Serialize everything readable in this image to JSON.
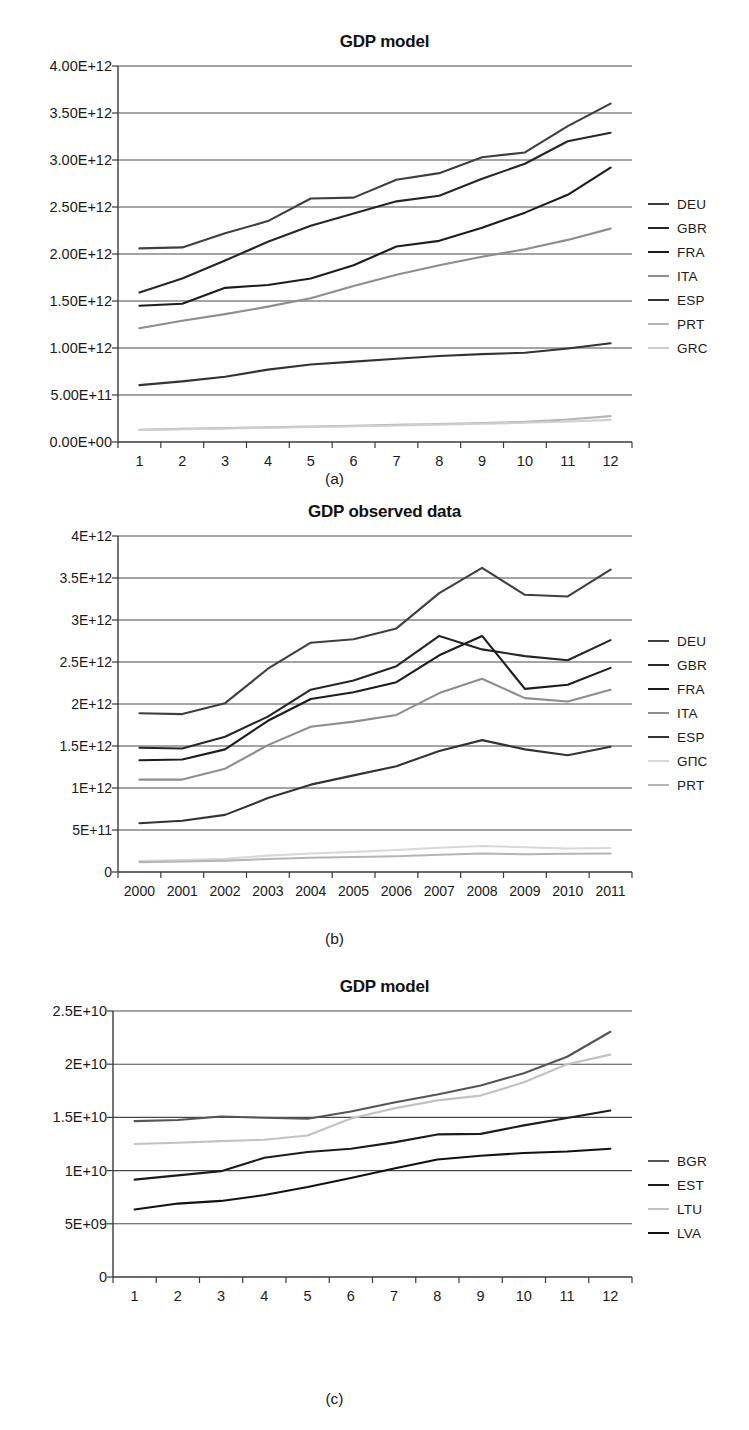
{
  "page": {
    "background": "#ffffff",
    "axis_color": "#3a3a3a",
    "grid_color": "#4a4a4a"
  },
  "figures": [
    {
      "id": "a",
      "caption": "(a)",
      "title": "GDP model",
      "legend": [
        {
          "label": "DEU",
          "color": "#3f3f3f",
          "width": 2.1
        },
        {
          "label": "GBR",
          "color": "#262626",
          "width": 2.1
        },
        {
          "label": "FRA",
          "color": "#1c1c1c",
          "width": 2.1
        },
        {
          "label": "ITA",
          "color": "#8d8d8d",
          "width": 2.1
        },
        {
          "label": "ESP",
          "color": "#333333",
          "width": 2.1
        },
        {
          "label": "PRT",
          "color": "#b5b5b5",
          "width": 2.1
        },
        {
          "label": "GRC",
          "color": "#cfcfcf",
          "width": 2.1
        }
      ]
    },
    {
      "id": "b",
      "caption": "(b)",
      "title": "GDP observed data",
      "legend": [
        {
          "label": "DEU",
          "color": "#3f3f3f",
          "width": 2.1
        },
        {
          "label": "GBR",
          "color": "#262626",
          "width": 2.1
        },
        {
          "label": "FRA",
          "color": "#1c1c1c",
          "width": 2.1
        },
        {
          "label": "ITA",
          "color": "#8d8d8d",
          "width": 2.1
        },
        {
          "label": "ESP",
          "color": "#333333",
          "width": 2.1
        },
        {
          "label": "GПC",
          "color": "#d8d8d8",
          "width": 2.1
        },
        {
          "label": "PRT",
          "color": "#b5b5b5",
          "width": 2.1
        }
      ]
    },
    {
      "id": "c",
      "caption": "(c)",
      "title": "GDP model",
      "legend": [
        {
          "label": "BGR",
          "color": "#555555",
          "width": 2.1
        },
        {
          "label": "EST",
          "color": "#1c1c1c",
          "width": 2.3
        },
        {
          "label": "LTU",
          "color": "#c2c2c2",
          "width": 2.1
        },
        {
          "label": "LVA",
          "color": "#111111",
          "width": 2.3
        }
      ]
    }
  ],
  "chart_data": [
    {
      "type": "line",
      "panel": "(a)",
      "title": "GDP model",
      "xlabel": "",
      "ylabel": "",
      "x": [
        1,
        2,
        3,
        4,
        5,
        6,
        7,
        8,
        9,
        10,
        11,
        12
      ],
      "xticklabels": [
        "1",
        "2",
        "3",
        "4",
        "5",
        "6",
        "7",
        "8",
        "9",
        "10",
        "11",
        "12"
      ],
      "ylim": [
        0,
        4000000000000.0
      ],
      "yticks": [
        0,
        500000000000.0,
        1000000000000.0,
        1500000000000.0,
        2000000000000.0,
        2500000000000.0,
        3000000000000.0,
        3500000000000.0,
        4000000000000.0
      ],
      "yticklabels": [
        "0.00E+00",
        "5.00E+11",
        "1.00E+12",
        "1.50E+12",
        "2.00E+12",
        "2.50E+12",
        "3.00E+12",
        "3.50E+12",
        "4.00E+12"
      ],
      "grid": true,
      "legend_position": "right",
      "series": [
        {
          "name": "DEU",
          "color": "#3f3f3f",
          "values": [
            2060000000000.0,
            2070000000000.0,
            2220000000000.0,
            2350000000000.0,
            2590000000000.0,
            2600000000000.0,
            2790000000000.0,
            2860000000000.0,
            3030000000000.0,
            3080000000000.0,
            3360000000000.0,
            3600000000000.0
          ]
        },
        {
          "name": "GBR",
          "color": "#262626",
          "values": [
            1590000000000.0,
            1740000000000.0,
            1930000000000.0,
            2130000000000.0,
            2300000000000.0,
            2430000000000.0,
            2560000000000.0,
            2620000000000.0,
            2800000000000.0,
            2960000000000.0,
            3200000000000.0,
            3290000000000.0
          ]
        },
        {
          "name": "FRA",
          "color": "#1c1c1c",
          "values": [
            1450000000000.0,
            1470000000000.0,
            1640000000000.0,
            1670000000000.0,
            1740000000000.0,
            1880000000000.0,
            2080000000000.0,
            2140000000000.0,
            2280000000000.0,
            2440000000000.0,
            2630000000000.0,
            2920000000000.0
          ]
        },
        {
          "name": "ITA",
          "color": "#8d8d8d",
          "values": [
            1210000000000.0,
            1290000000000.0,
            1360000000000.0,
            1440000000000.0,
            1530000000000.0,
            1660000000000.0,
            1780000000000.0,
            1880000000000.0,
            1970000000000.0,
            2050000000000.0,
            2150000000000.0,
            2270000000000.0
          ]
        },
        {
          "name": "ESP",
          "color": "#333333",
          "values": [
            605000000000.0,
            645000000000.0,
            695000000000.0,
            770000000000.0,
            825000000000.0,
            855000000000.0,
            885000000000.0,
            915000000000.0,
            935000000000.0,
            950000000000.0,
            995000000000.0,
            1050000000000.0
          ]
        },
        {
          "name": "PRT",
          "color": "#b5b5b5",
          "values": [
            130000000000.0,
            140000000000.0,
            148000000000.0,
            156000000000.0,
            164000000000.0,
            172000000000.0,
            182000000000.0,
            192000000000.0,
            202000000000.0,
            214000000000.0,
            240000000000.0,
            275000000000.0
          ]
        },
        {
          "name": "GRC",
          "color": "#cfcfcf",
          "values": [
            127000000000.0,
            136000000000.0,
            144000000000.0,
            152000000000.0,
            159000000000.0,
            167000000000.0,
            176000000000.0,
            185000000000.0,
            194000000000.0,
            204000000000.0,
            218000000000.0,
            235000000000.0
          ]
        }
      ]
    },
    {
      "type": "line",
      "panel": "(b)",
      "title": "GDP observed data",
      "xlabel": "",
      "ylabel": "",
      "x": [
        2000,
        2001,
        2002,
        2003,
        2004,
        2005,
        2006,
        2007,
        2008,
        2009,
        2010,
        2011
      ],
      "xticklabels": [
        "2000",
        "2001",
        "2002",
        "2003",
        "2004",
        "2005",
        "2006",
        "2007",
        "2008",
        "2009",
        "2010",
        "2011"
      ],
      "ylim": [
        0,
        4000000000000.0
      ],
      "yticks": [
        0,
        500000000000.0,
        1000000000000.0,
        1500000000000.0,
        2000000000000.0,
        2500000000000.0,
        3000000000000.0,
        3500000000000.0,
        4000000000000.0
      ],
      "yticklabels": [
        "0",
        "5E+11",
        "1E+12",
        "1.5E+12",
        "2E+12",
        "2.5E+12",
        "3E+12",
        "3.5E+12",
        "4E+12"
      ],
      "grid": true,
      "legend_position": "right",
      "series": [
        {
          "name": "DEU",
          "color": "#3f3f3f",
          "values": [
            1890000000000.0,
            1880000000000.0,
            2010000000000.0,
            2420000000000.0,
            2730000000000.0,
            2770000000000.0,
            2900000000000.0,
            3320000000000.0,
            3620000000000.0,
            3300000000000.0,
            3280000000000.0,
            3600000000000.0
          ]
        },
        {
          "name": "GBR",
          "color": "#262626",
          "values": [
            1480000000000.0,
            1470000000000.0,
            1610000000000.0,
            1850000000000.0,
            2170000000000.0,
            2280000000000.0,
            2450000000000.0,
            2810000000000.0,
            2650000000000.0,
            2570000000000.0,
            2520000000000.0,
            2760000000000.0
          ]
        },
        {
          "name": "FRA",
          "color": "#1c1c1c",
          "values": [
            1330000000000.0,
            1340000000000.0,
            1460000000000.0,
            1800000000000.0,
            2060000000000.0,
            2140000000000.0,
            2260000000000.0,
            2580000000000.0,
            2810000000000.0,
            2180000000000.0,
            2230000000000.0,
            2430000000000.0
          ]
        },
        {
          "name": "ITA",
          "color": "#8d8d8d",
          "values": [
            1100000000000.0,
            1100000000000.0,
            1230000000000.0,
            1510000000000.0,
            1730000000000.0,
            1790000000000.0,
            1870000000000.0,
            2130000000000.0,
            2300000000000.0,
            2070000000000.0,
            2030000000000.0,
            2170000000000.0
          ]
        },
        {
          "name": "ESP",
          "color": "#333333",
          "values": [
            580000000000.0,
            610000000000.0,
            680000000000.0,
            880000000000.0,
            1040000000000.0,
            1150000000000.0,
            1260000000000.0,
            1440000000000.0,
            1570000000000.0,
            1460000000000.0,
            1390000000000.0,
            1490000000000.0
          ]
        },
        {
          "name": "GПC",
          "color": "#d8d8d8",
          "values": [
            130000000000.0,
            143000000000.0,
            157000000000.0,
            195000000000.0,
            220000000000.0,
            240000000000.0,
            262000000000.0,
            288000000000.0,
            310000000000.0,
            295000000000.0,
            280000000000.0,
            285000000000.0
          ]
        },
        {
          "name": "PRT",
          "color": "#b5b5b5",
          "values": [
            118000000000.0,
            125000000000.0,
            135000000000.0,
            155000000000.0,
            170000000000.0,
            178000000000.0,
            187000000000.0,
            205000000000.0,
            220000000000.0,
            212000000000.0,
            218000000000.0,
            220000000000.0
          ]
        }
      ]
    },
    {
      "type": "line",
      "panel": "(c)",
      "title": "GDP model",
      "xlabel": "",
      "ylabel": "",
      "x": [
        1,
        2,
        3,
        4,
        5,
        6,
        7,
        8,
        9,
        10,
        11,
        12
      ],
      "xticklabels": [
        "1",
        "2",
        "3",
        "4",
        "5",
        "6",
        "7",
        "8",
        "9",
        "10",
        "11",
        "12"
      ],
      "ylim": [
        0,
        25000000000.0
      ],
      "yticks": [
        0,
        5000000000.0,
        10000000000.0,
        15000000000.0,
        20000000000.0,
        25000000000.0
      ],
      "yticklabels": [
        "0",
        "5E+09",
        "1E+10",
        "1.5E+10",
        "2E+10",
        "2.5E+10"
      ],
      "grid": true,
      "legend_position": "right",
      "series": [
        {
          "name": "BGR",
          "color": "#555555",
          "values": [
            14650000000.0,
            14750000000.0,
            15080000000.0,
            14970000000.0,
            14870000000.0,
            15550000000.0,
            16400000000.0,
            17150000000.0,
            18000000000.0,
            19150000000.0,
            20700000000.0,
            23050000000.0
          ]
        },
        {
          "name": "EST",
          "color": "#1c1c1c",
          "values": [
            9150000000.0,
            9550000000.0,
            9950000000.0,
            11200000000.0,
            11750000000.0,
            12050000000.0,
            12650000000.0,
            13400000000.0,
            13450000000.0,
            14250000000.0,
            14950000000.0,
            15650000000.0
          ]
        },
        {
          "name": "LTU",
          "color": "#c2c2c2",
          "values": [
            12500000000.0,
            12620000000.0,
            12770000000.0,
            12900000000.0,
            13300000000.0,
            14900000000.0,
            15850000000.0,
            16600000000.0,
            17050000000.0,
            18300000000.0,
            20000000000.0,
            20900000000.0
          ]
        },
        {
          "name": "LVA",
          "color": "#111111",
          "values": [
            6350000000.0,
            6900000000.0,
            7150000000.0,
            7700000000.0,
            8450000000.0,
            9300000000.0,
            10200000000.0,
            11050000000.0,
            11400000000.0,
            11650000000.0,
            11800000000.0,
            12050000000.0
          ]
        }
      ]
    }
  ]
}
